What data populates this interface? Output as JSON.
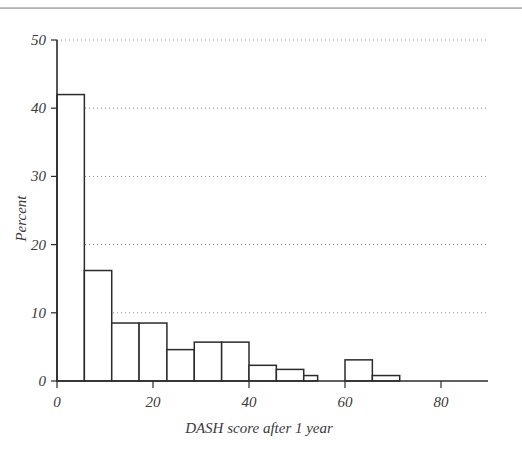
{
  "figure": {
    "background": "#ffffff",
    "ink_color": "#2b2b2b",
    "grid_color": "#8a8a8a",
    "bar_fill": "#ffffff"
  },
  "chart_data": {
    "type": "bar",
    "title": "",
    "subtitle": "",
    "xlabel": "DASH score after 1 year",
    "ylabel": "Percent",
    "xlim": [
      0,
      90
    ],
    "ylim": [
      0,
      50
    ],
    "grid": true,
    "grid_axis": "y",
    "grid_style": "dotted",
    "legend": "none",
    "xticks": [
      0,
      20,
      40,
      60,
      80
    ],
    "xtick_labels": [
      "0",
      "20",
      "40",
      "60",
      "80"
    ],
    "yticks": [
      0,
      10,
      20,
      30,
      40,
      50
    ],
    "ytick_labels": [
      "0",
      "10",
      "20",
      "30",
      "40",
      "50"
    ],
    "bin_width": 5.7,
    "bin_edges": [
      0,
      5.7,
      11.4,
      17.1,
      22.9,
      28.6,
      34.3,
      40.0,
      45.7,
      51.4,
      57.1,
      60.0,
      65.7,
      71.4
    ],
    "categories": [
      "0-5.7",
      "5.7-11.4",
      "11.4-17.1",
      "17.1-22.9",
      "22.9-28.6",
      "28.6-34.3",
      "34.3-40.0",
      "40.0-45.7",
      "45.7-51.4",
      "51.4-57.1",
      "60.0-65.7",
      "65.7-71.4"
    ],
    "bars": [
      {
        "x0": 0.0,
        "x1": 5.7,
        "value": 42.0
      },
      {
        "x0": 5.7,
        "x1": 11.4,
        "value": 16.2
      },
      {
        "x0": 11.4,
        "x1": 17.1,
        "value": 8.5
      },
      {
        "x0": 17.1,
        "x1": 22.9,
        "value": 8.5
      },
      {
        "x0": 22.9,
        "x1": 28.6,
        "value": 4.6
      },
      {
        "x0": 28.6,
        "x1": 34.3,
        "value": 5.7
      },
      {
        "x0": 34.3,
        "x1": 40.0,
        "value": 5.7
      },
      {
        "x0": 40.0,
        "x1": 45.7,
        "value": 2.3
      },
      {
        "x0": 45.7,
        "x1": 51.4,
        "value": 1.7
      },
      {
        "x0": 51.4,
        "x1": 54.3,
        "value": 0.8
      },
      {
        "x0": 60.0,
        "x1": 65.7,
        "value": 3.1
      },
      {
        "x0": 65.7,
        "x1": 71.4,
        "value": 0.8
      }
    ],
    "values": [
      42.0,
      16.2,
      8.5,
      8.5,
      4.6,
      5.7,
      5.7,
      2.3,
      1.7,
      0.8,
      3.1,
      0.8
    ]
  }
}
